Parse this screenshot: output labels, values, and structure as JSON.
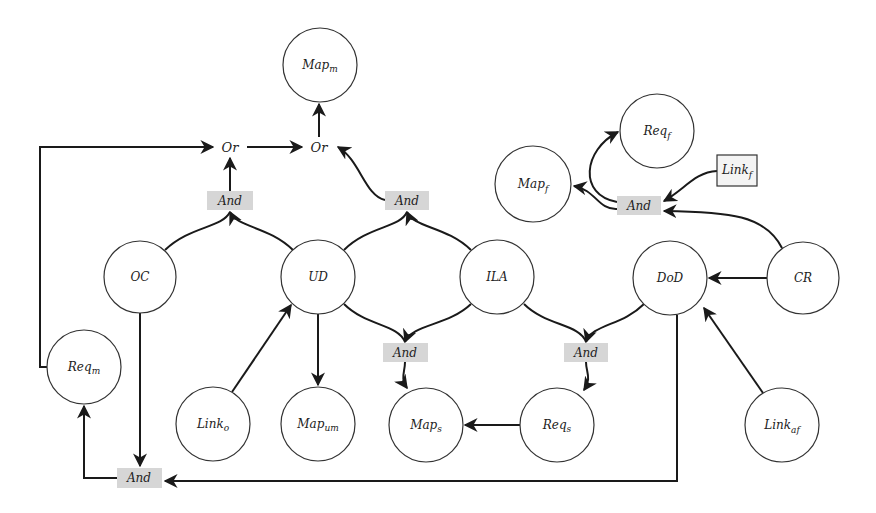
{
  "diagram": {
    "type": "goal-dependency-graph",
    "nodes": [
      {
        "id": "Map_m",
        "base": "Map",
        "sub": "m",
        "shape": "circle",
        "x": 320,
        "y": 65
      },
      {
        "id": "Req_f",
        "base": "Req",
        "sub": "f",
        "shape": "circle",
        "x": 657,
        "y": 131
      },
      {
        "id": "Map_f",
        "base": "Map",
        "sub": "f",
        "shape": "circle",
        "x": 533,
        "y": 184
      },
      {
        "id": "Link_f",
        "base": "Link",
        "sub": "f",
        "shape": "box",
        "x": 737,
        "y": 171
      },
      {
        "id": "OC",
        "base": "OC",
        "sub": "",
        "shape": "circle",
        "x": 140,
        "y": 277
      },
      {
        "id": "UD",
        "base": "UD",
        "sub": "",
        "shape": "circle",
        "x": 318,
        "y": 277
      },
      {
        "id": "ILA",
        "base": "ILA",
        "sub": "",
        "shape": "circle",
        "x": 497,
        "y": 277
      },
      {
        "id": "DoD",
        "base": "DoD",
        "sub": "",
        "shape": "circle",
        "x": 670,
        "y": 278
      },
      {
        "id": "CR",
        "base": "CR",
        "sub": "",
        "shape": "circle",
        "x": 803,
        "y": 278
      },
      {
        "id": "Req_m",
        "base": "Req",
        "sub": "m",
        "shape": "circle",
        "x": 84,
        "y": 367
      },
      {
        "id": "Link_o",
        "base": "Link",
        "sub": "o",
        "shape": "circle",
        "x": 213,
        "y": 424
      },
      {
        "id": "Map_um",
        "base": "Map",
        "sub": "um",
        "shape": "circle",
        "x": 318,
        "y": 424
      },
      {
        "id": "Map_s",
        "base": "Map",
        "sub": "s",
        "shape": "circle",
        "x": 426,
        "y": 425
      },
      {
        "id": "Req_s",
        "base": "Req",
        "sub": "s",
        "shape": "circle",
        "x": 557,
        "y": 425
      },
      {
        "id": "Link_af",
        "base": "Link",
        "sub": "af",
        "shape": "circle",
        "x": 782,
        "y": 425
      }
    ],
    "gates": [
      {
        "id": "Or1",
        "label": "Or",
        "kind": "or",
        "x": 230,
        "y": 147
      },
      {
        "id": "Or2",
        "label": "Or",
        "kind": "or",
        "x": 319,
        "y": 147
      },
      {
        "id": "And1",
        "label": "And",
        "kind": "and",
        "x": 230,
        "y": 200
      },
      {
        "id": "And2",
        "label": "And",
        "kind": "and",
        "x": 407,
        "y": 200
      },
      {
        "id": "And_f",
        "label": "And",
        "kind": "and",
        "x": 639,
        "y": 205
      },
      {
        "id": "And3",
        "label": "And",
        "kind": "and",
        "x": 405,
        "y": 352
      },
      {
        "id": "And4",
        "label": "And",
        "kind": "and",
        "x": 586,
        "y": 352
      },
      {
        "id": "And5",
        "label": "And",
        "kind": "and",
        "x": 140,
        "y": 478
      }
    ],
    "edges": [
      {
        "from": "OC",
        "to": "And1"
      },
      {
        "from": "UD",
        "to": "And1"
      },
      {
        "from": "And1",
        "to": "Or1"
      },
      {
        "from": "Req_m",
        "to": "Or1"
      },
      {
        "from": "Or1",
        "to": "Or2"
      },
      {
        "from": "UD",
        "to": "And2"
      },
      {
        "from": "ILA",
        "to": "And2"
      },
      {
        "from": "And2",
        "to": "Or2"
      },
      {
        "from": "Or2",
        "to": "Map_m"
      },
      {
        "from": "Link_f",
        "to": "And_f"
      },
      {
        "from": "CR",
        "to": "And_f"
      },
      {
        "from": "And_f",
        "to": "Map_f"
      },
      {
        "from": "And_f",
        "to": "Req_f"
      },
      {
        "from": "CR",
        "to": "DoD"
      },
      {
        "from": "Link_af",
        "to": "DoD"
      },
      {
        "from": "Link_o",
        "to": "UD"
      },
      {
        "from": "UD",
        "to": "Map_um"
      },
      {
        "from": "UD",
        "to": "And3"
      },
      {
        "from": "ILA",
        "to": "And3"
      },
      {
        "from": "And3",
        "to": "Map_s"
      },
      {
        "from": "ILA",
        "to": "And4"
      },
      {
        "from": "DoD",
        "to": "And4"
      },
      {
        "from": "And4",
        "to": "Req_s"
      },
      {
        "from": "Req_s",
        "to": "Map_s"
      },
      {
        "from": "OC",
        "to": "And5"
      },
      {
        "from": "DoD",
        "to": "And5"
      },
      {
        "from": "And5",
        "to": "Req_m"
      }
    ]
  },
  "labels": {
    "map_m": "Map",
    "map_m_sub": "m",
    "req_f": "Req",
    "req_f_sub": "f",
    "map_f": "Map",
    "map_f_sub": "f",
    "link_f": "Link",
    "link_f_sub": "f",
    "oc": "OC",
    "ud": "UD",
    "ila": "ILA",
    "dod": "DoD",
    "cr": "CR",
    "req_m": "Req",
    "req_m_sub": "m",
    "link_o": "Link",
    "link_o_sub": "o",
    "map_um": "Map",
    "map_um_sub": "um",
    "map_s": "Map",
    "map_s_sub": "s",
    "req_s": "Req",
    "req_s_sub": "s",
    "link_af": "Link",
    "link_af_sub": "af",
    "or": "Or",
    "and": "And"
  },
  "colors": {
    "gate_fill": "#d6d6d6",
    "stroke": "#1a1a1a",
    "background": "#ffffff"
  }
}
